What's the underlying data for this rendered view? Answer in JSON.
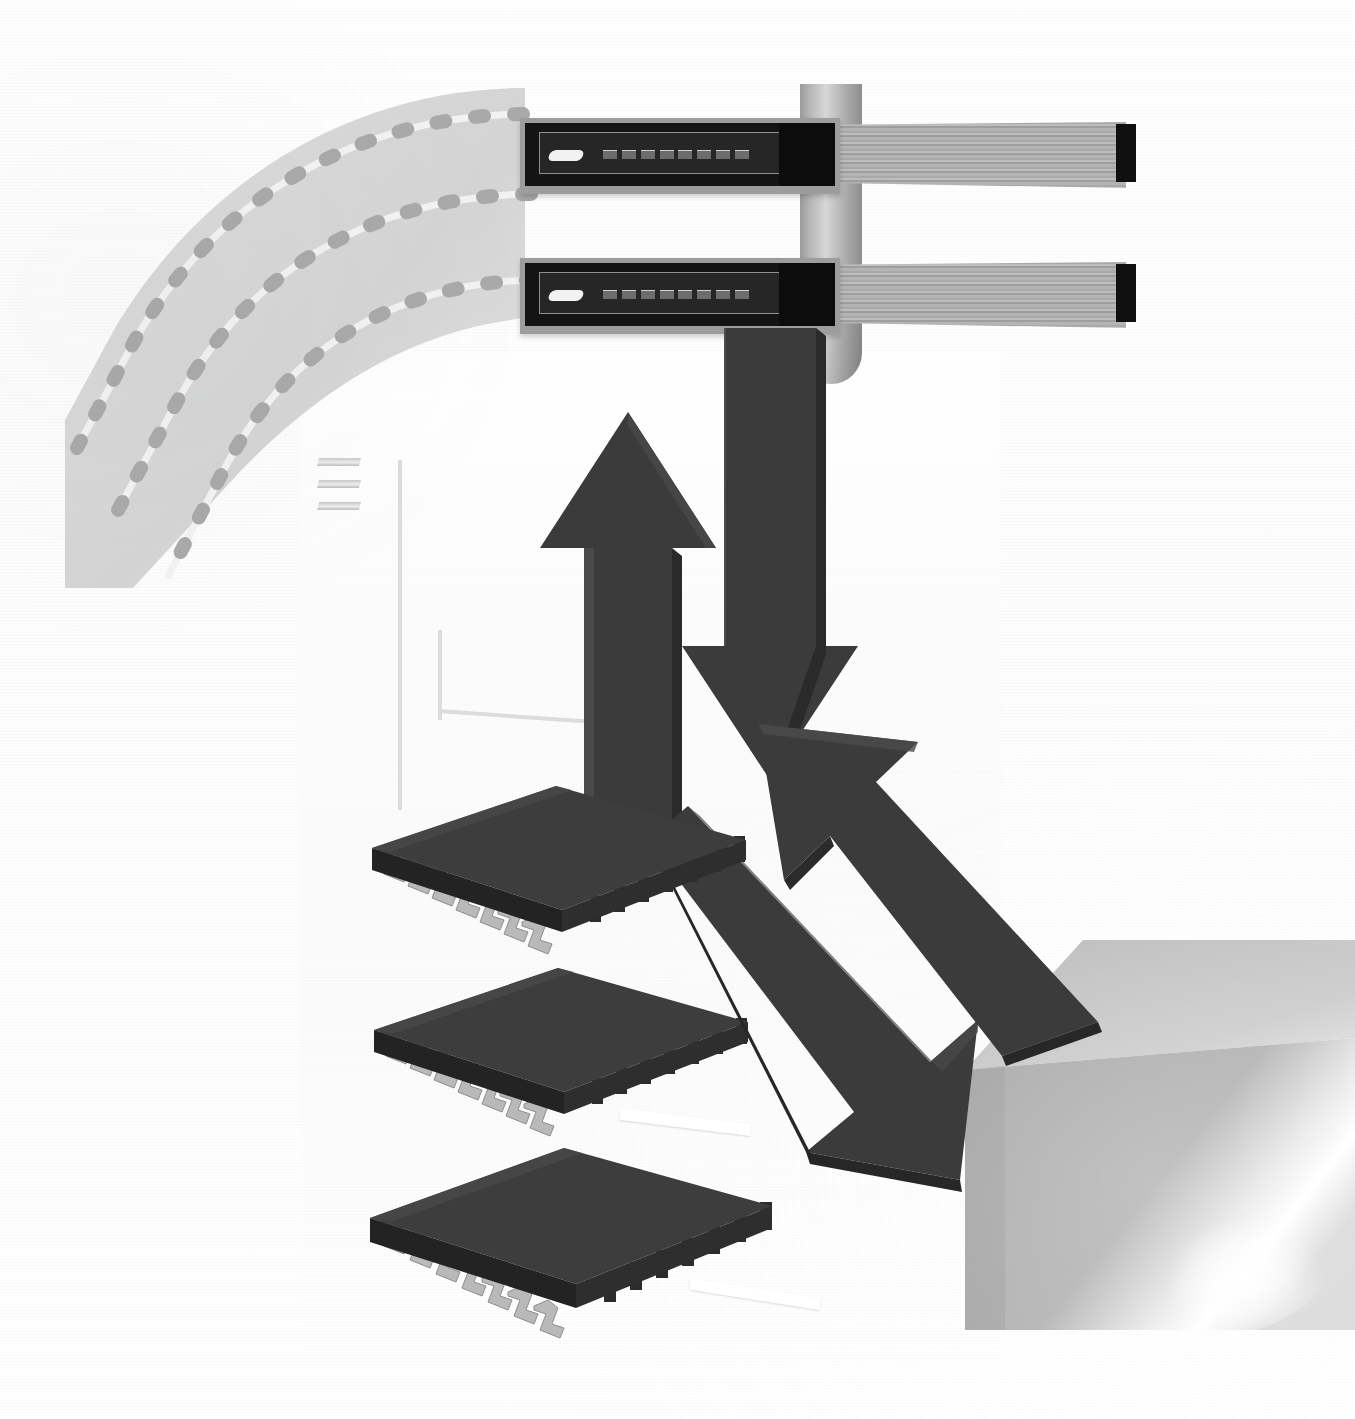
{
  "figure": {
    "background_color": "#ffffff",
    "accent_dark": "#3a3a3a",
    "accent_mid": "#8e8e8e",
    "accent_light": "#dcdcdc"
  },
  "flex_band": {
    "name": "curved flexible circuit band",
    "fill": "#d8d8d8",
    "trace_color": "#f0f0f0",
    "via_color": "#a8a8a8",
    "trace_count": 3,
    "vias_per_trace": 14
  },
  "tube": {
    "name": "vertical cylindrical standoff",
    "fill_light": "#d7d7d7",
    "fill_dark": "#8d8d8d"
  },
  "cables": [
    {
      "name": "upper ribbon cable assembly",
      "connector_label": "edge connector",
      "connector_fill": "#141414",
      "frame_fill": "#9d9d9d",
      "ribbon_fill": "#b0b0b0",
      "end_cap_fill": "#101010",
      "pin_count": 8
    },
    {
      "name": "lower ribbon cable assembly",
      "connector_label": "edge connector",
      "connector_fill": "#141414",
      "frame_fill": "#9d9d9d",
      "ribbon_fill": "#b0b0b0",
      "end_cap_fill": "#101010",
      "pin_count": 8
    }
  ],
  "arrows": [
    {
      "name": "up-arrow",
      "direction": "up",
      "fill": "#3b3b3b",
      "side_fill": "#2a2a2a"
    },
    {
      "name": "down-arrow",
      "direction": "down",
      "fill": "#3b3b3b",
      "side_fill": "#2a2a2a"
    },
    {
      "name": "diagonal-up-left-arrow",
      "direction": "up-left",
      "fill": "#3b3b3b",
      "side_fill": "#272727"
    },
    {
      "name": "diagonal-down-right-arrow",
      "direction": "down-right",
      "fill": "#3b3b3b",
      "side_fill": "#272727"
    }
  ],
  "chips": [
    {
      "name": "top integrated circuit",
      "top_fill": "#3d3d3d",
      "edge_fill": "#242424",
      "pin_fill": "#b9b9b9"
    },
    {
      "name": "middle integrated circuit",
      "top_fill": "#3d3d3d",
      "edge_fill": "#242424",
      "pin_fill": "#b9b9b9"
    },
    {
      "name": "bottom integrated circuit",
      "top_fill": "#3d3d3d",
      "edge_fill": "#242424",
      "pin_fill": "#b9b9b9"
    }
  ],
  "block": {
    "name": "grey enclosure corner block",
    "top_fill": "#bdbdbd",
    "front_fill": "#9a9a9a",
    "highlight": "#ffffff"
  },
  "board_outline": {
    "name": "engraved board outline",
    "stroke": "#dcdcdc",
    "slot_dash_count": 3
  }
}
